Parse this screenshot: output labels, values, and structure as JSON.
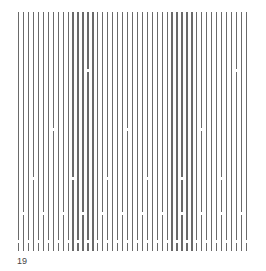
{
  "figure": {
    "label": "19",
    "line_color": "#6a6a6a",
    "background": "#ffffff",
    "lines": {
      "count": 47,
      "x_start": 18,
      "spacing": 4.95,
      "y_top": 12,
      "y_bottom": 251
    },
    "gap_rows": [
      {
        "y": 69,
        "every_n_lines": 30,
        "offset": 14
      },
      {
        "y": 128,
        "every_n_lines": 15,
        "offset": 7
      },
      {
        "y": 177,
        "every_n_lines": 7.5,
        "offset": 3
      },
      {
        "y": 212,
        "every_n_lines": 4,
        "offset": 1
      },
      {
        "y": 240,
        "every_n_lines": 2,
        "offset": 0
      }
    ]
  }
}
